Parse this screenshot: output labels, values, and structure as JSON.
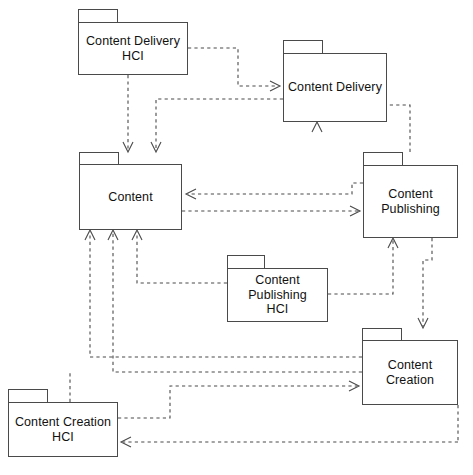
{
  "diagram": {
    "type": "uml-package-diagram",
    "width": 473,
    "height": 475,
    "background_color": "#ffffff",
    "line_color": "#4a4a4a",
    "text_color": "#111111",
    "line_style": "dashed",
    "arrow_style": "open-v",
    "packages": [
      {
        "id": "content-delivery-hci",
        "label": "Content Delivery\nHCI",
        "tab": {
          "x": 78,
          "y": 9,
          "w": 40,
          "h": 13
        },
        "body": {
          "x": 78,
          "y": 22,
          "w": 110,
          "h": 53
        }
      },
      {
        "id": "content-delivery",
        "label": "Content Delivery",
        "tab": {
          "x": 283,
          "y": 40,
          "w": 40,
          "h": 13
        },
        "body": {
          "x": 283,
          "y": 53,
          "w": 104,
          "h": 69
        }
      },
      {
        "id": "content",
        "label": "Content",
        "tab": {
          "x": 79,
          "y": 152,
          "w": 40,
          "h": 12
        },
        "body": {
          "x": 79,
          "y": 164,
          "w": 103,
          "h": 66
        }
      },
      {
        "id": "content-publishing",
        "label": "Content\nPublishing",
        "tab": {
          "x": 363,
          "y": 152,
          "w": 40,
          "h": 13
        },
        "body": {
          "x": 363,
          "y": 165,
          "w": 95,
          "h": 73
        }
      },
      {
        "id": "content-publishing-hci",
        "label": "Content\nPublishing\nHCI",
        "tab": {
          "x": 227,
          "y": 255,
          "w": 38,
          "h": 13
        },
        "body": {
          "x": 227,
          "y": 268,
          "w": 101,
          "h": 54
        }
      },
      {
        "id": "content-creation",
        "label": "Content Creation",
        "tab": {
          "x": 362,
          "y": 328,
          "w": 40,
          "h": 12
        },
        "body": {
          "x": 362,
          "y": 340,
          "w": 96,
          "h": 65
        }
      },
      {
        "id": "content-creation-hci",
        "label": "Content Creation\nHCI",
        "tab": {
          "x": 8,
          "y": 389,
          "w": 40,
          "h": 13
        },
        "body": {
          "x": 8,
          "y": 402,
          "w": 110,
          "h": 55
        }
      }
    ],
    "dependencies": [
      {
        "from": "content-delivery-hci",
        "to": "content-delivery",
        "label": ""
      },
      {
        "from": "content-delivery-hci",
        "to": "content",
        "label": ""
      },
      {
        "from": "content-delivery",
        "to": "content",
        "label": ""
      },
      {
        "from": "content",
        "to": "content-publishing",
        "label": ""
      },
      {
        "from": "content-publishing",
        "to": "content",
        "label": ""
      },
      {
        "from": "content-publishing",
        "to": "content-delivery",
        "label": ""
      },
      {
        "from": "content-publishing",
        "to": "content-creation",
        "label": ""
      },
      {
        "from": "content-publishing-hci",
        "to": "content",
        "label": ""
      },
      {
        "from": "content-publishing-hci",
        "to": "content-publishing",
        "label": ""
      },
      {
        "from": "content-creation",
        "to": "content",
        "label": ""
      },
      {
        "from": "content-creation",
        "to": "content-publishing",
        "label": ""
      },
      {
        "from": "content-creation-hci",
        "to": "content-creation",
        "label": ""
      },
      {
        "from": "content-creation-hci",
        "to": "content",
        "label": ""
      }
    ]
  }
}
